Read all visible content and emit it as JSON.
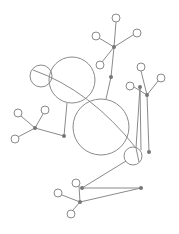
{
  "diagram": {
    "type": "network-graph",
    "stroke_color": "#8a8a8a",
    "dot_color": "#777777",
    "background": "#ffffff",
    "large_circles": [
      {
        "id": "c-medium",
        "cx": 72,
        "cy": 80,
        "r": 23
      },
      {
        "id": "c-small-overlap",
        "cx": 41,
        "cy": 76,
        "r": 11
      },
      {
        "id": "c-big",
        "cx": 101,
        "cy": 127,
        "r": 28
      },
      {
        "id": "c-lower",
        "cx": 133,
        "cy": 156,
        "r": 9
      }
    ],
    "leaf_nodes": [
      {
        "id": "t1",
        "cx": 116,
        "cy": 18,
        "r": 4
      },
      {
        "id": "t2",
        "cx": 96,
        "cy": 36,
        "r": 4
      },
      {
        "id": "t3",
        "cx": 137,
        "cy": 33,
        "r": 4
      },
      {
        "id": "t4",
        "cx": 100,
        "cy": 65,
        "r": 4
      },
      {
        "id": "r1",
        "cx": 141,
        "cy": 67,
        "r": 4
      },
      {
        "id": "r2",
        "cx": 161,
        "cy": 78,
        "r": 4
      },
      {
        "id": "r3",
        "cx": 130,
        "cy": 86,
        "r": 4
      },
      {
        "id": "l1",
        "cx": 18,
        "cy": 113,
        "r": 4
      },
      {
        "id": "l2",
        "cx": 45,
        "cy": 110,
        "r": 4
      },
      {
        "id": "l3",
        "cx": 15,
        "cy": 139,
        "r": 4
      },
      {
        "id": "b1",
        "cx": 76,
        "cy": 183,
        "r": 4
      },
      {
        "id": "b2",
        "cx": 58,
        "cy": 193,
        "r": 4
      },
      {
        "id": "b3",
        "cx": 71,
        "cy": 214,
        "r": 4
      }
    ],
    "dots": [
      {
        "id": "hub-top",
        "cx": 114,
        "cy": 47
      },
      {
        "id": "mid-top",
        "cx": 111,
        "cy": 77
      },
      {
        "id": "hub-r1",
        "cx": 140,
        "cy": 87
      },
      {
        "id": "hub-r2",
        "cx": 147,
        "cy": 95
      },
      {
        "id": "end-r",
        "cx": 149,
        "cy": 152
      },
      {
        "id": "hub-l",
        "cx": 35,
        "cy": 128
      },
      {
        "id": "end-l",
        "cx": 64,
        "cy": 136
      },
      {
        "id": "hub-b1",
        "cx": 82,
        "cy": 188
      },
      {
        "id": "hub-b2",
        "cx": 80,
        "cy": 202
      },
      {
        "id": "end-b",
        "cx": 141,
        "cy": 188
      }
    ],
    "edges": [
      {
        "x1": 116,
        "y1": 22,
        "x2": 114,
        "y2": 47
      },
      {
        "x1": 99,
        "y1": 38,
        "x2": 114,
        "y2": 47
      },
      {
        "x1": 133,
        "y1": 35,
        "x2": 114,
        "y2": 47
      },
      {
        "x1": 102,
        "y1": 62,
        "x2": 114,
        "y2": 47
      },
      {
        "x1": 114,
        "y1": 47,
        "x2": 111,
        "y2": 77
      },
      {
        "x1": 111,
        "y1": 77,
        "x2": 106,
        "y2": 99
      },
      {
        "x1": 141,
        "y1": 71,
        "x2": 147,
        "y2": 95
      },
      {
        "x1": 158,
        "y1": 81,
        "x2": 147,
        "y2": 95
      },
      {
        "x1": 134,
        "y1": 87,
        "x2": 147,
        "y2": 95
      },
      {
        "x1": 140,
        "y1": 87,
        "x2": 141,
        "y2": 150
      },
      {
        "x1": 140,
        "y1": 87,
        "x2": 136,
        "y2": 148
      },
      {
        "x1": 147,
        "y1": 95,
        "x2": 149,
        "y2": 152
      },
      {
        "x1": 21,
        "y1": 116,
        "x2": 35,
        "y2": 128
      },
      {
        "x1": 43,
        "y1": 114,
        "x2": 35,
        "y2": 128
      },
      {
        "x1": 18,
        "y1": 137,
        "x2": 35,
        "y2": 128
      },
      {
        "x1": 35,
        "y1": 128,
        "x2": 64,
        "y2": 136
      },
      {
        "x1": 64,
        "y1": 136,
        "x2": 67,
        "y2": 103
      },
      {
        "x1": 79,
        "y1": 186,
        "x2": 80,
        "y2": 202
      },
      {
        "x1": 62,
        "y1": 195,
        "x2": 80,
        "y2": 202
      },
      {
        "x1": 73,
        "y1": 210,
        "x2": 80,
        "y2": 202
      },
      {
        "x1": 82,
        "y1": 188,
        "x2": 141,
        "y2": 188
      },
      {
        "x1": 80,
        "y1": 202,
        "x2": 141,
        "y2": 188
      },
      {
        "x1": 82,
        "y1": 188,
        "x2": 126,
        "y2": 161
      }
    ],
    "curves": [
      {
        "d": "M 33 70 Q 90 90 136 148 L 139 162"
      }
    ]
  }
}
